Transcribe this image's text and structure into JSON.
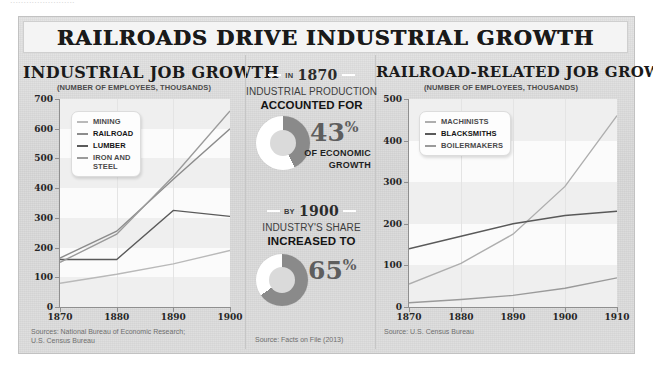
{
  "ghost_text": "........................",
  "banner": {
    "title": "RAILROADS DRIVE INDUSTRIAL GROWTH"
  },
  "colors": {
    "mining": "#b9b9b9",
    "railroad": "#8c8c8c",
    "lumber": "#5a5a5a",
    "iron_steel": "#9b9b9b",
    "machinists": "#aeaeae",
    "blacksmiths": "#595959",
    "boilermakers": "#9a9a9a",
    "donut_filled": "#ffffff",
    "donut_remainder": "#8a8a8a",
    "poster_bg": "#d9d9d9",
    "plot_bg": "#fbfbfb",
    "band": "#efefef",
    "text": "#1a1a1a"
  },
  "left_panel": {
    "title": "INDUSTRIAL JOB GROWTH",
    "subtitle": "(NUMBER OF EMPLOYEES, THOUSANDS)",
    "source": "Sources: National Bureau of Economic Research;\nU.S. Census Bureau",
    "legend": [
      {
        "label": "MINING",
        "color": "#b9b9b9",
        "bold": false
      },
      {
        "label": "RAILROAD",
        "color": "#8c8c8c",
        "bold": true
      },
      {
        "label": "LUMBER",
        "color": "#5a5a5a",
        "bold": true
      },
      {
        "label": "IRON AND\nSTEEL",
        "color": "#9b9b9b",
        "bold": false
      }
    ]
  },
  "mid_panel": {
    "source": "Source: Facts on File (2013)",
    "stats": [
      {
        "year_pre": "IN",
        "year": "1870",
        "line1": "INDUSTRIAL PRODUCTION",
        "line2": "ACCOUNTED FOR",
        "percent": "43",
        "percent_symbol": "%",
        "tail": "OF ECONOMIC\nGROWTH"
      },
      {
        "year_pre": "BY",
        "year": "1900",
        "line1": "INDUSTRY'S SHARE",
        "line2": "INCREASED TO",
        "percent": "65",
        "percent_symbol": "%",
        "tail": ""
      }
    ]
  },
  "right_panel": {
    "title": "RAILROAD-RELATED JOB GROWTH",
    "subtitle": "(NUMBER OF EMPLOYEES, THOUSANDS)",
    "source": "Source: U.S. Census Bureau",
    "legend": [
      {
        "label": "MACHINISTS",
        "color": "#aeaeae",
        "bold": false
      },
      {
        "label": "BLACKSMITHS",
        "color": "#595959",
        "bold": true
      },
      {
        "label": "BOILERMAKERS",
        "color": "#9a9a9a",
        "bold": false
      }
    ]
  },
  "chart_data": [
    {
      "id": "industrial-job-growth",
      "type": "line",
      "title": "INDUSTRIAL JOB GROWTH",
      "subtitle": "(NUMBER OF EMPLOYEES, THOUSANDS)",
      "xlabel": "",
      "ylabel": "NUMBER OF EMPLOYEES, THOUSANDS",
      "x": [
        1870,
        1880,
        1890,
        1900
      ],
      "xticks": [
        "1870",
        "1880",
        "1890",
        "1900"
      ],
      "yticks": [
        0,
        100,
        200,
        300,
        400,
        500,
        600,
        700
      ],
      "xlim": [
        1870,
        1900
      ],
      "ylim": [
        0,
        700
      ],
      "grid": true,
      "legend_position": "top-left",
      "series": [
        {
          "name": "MINING",
          "color": "#b9b9b9",
          "values": [
            80,
            110,
            145,
            190
          ]
        },
        {
          "name": "RAILROAD",
          "color": "#8c8c8c",
          "values": [
            165,
            255,
            430,
            600
          ]
        },
        {
          "name": "LUMBER",
          "color": "#5a5a5a",
          "values": [
            160,
            160,
            325,
            305
          ]
        },
        {
          "name": "IRON AND STEEL",
          "color": "#9b9b9b",
          "values": [
            150,
            245,
            440,
            660
          ]
        }
      ],
      "source": "Sources: National Bureau of Economic Research; U.S. Census Bureau"
    },
    {
      "id": "railroad-related-job-growth",
      "type": "line",
      "title": "RAILROAD-RELATED JOB GROWTH",
      "subtitle": "(NUMBER OF EMPLOYEES, THOUSANDS)",
      "xlabel": "",
      "ylabel": "NUMBER OF EMPLOYEES, THOUSANDS",
      "x": [
        1870,
        1880,
        1890,
        1900,
        1910
      ],
      "xticks": [
        "1870",
        "1880",
        "1890",
        "1900",
        "1910"
      ],
      "yticks": [
        0,
        100,
        200,
        300,
        400,
        500
      ],
      "xlim": [
        1870,
        1910
      ],
      "ylim": [
        0,
        500
      ],
      "grid": true,
      "legend_position": "top-left",
      "series": [
        {
          "name": "MACHINISTS",
          "color": "#aeaeae",
          "values": [
            55,
            105,
            175,
            290,
            460
          ]
        },
        {
          "name": "BLACKSMITHS",
          "color": "#595959",
          "values": [
            140,
            170,
            200,
            220,
            230
          ]
        },
        {
          "name": "BOILERMAKERS",
          "color": "#9a9a9a",
          "values": [
            10,
            18,
            28,
            45,
            70
          ]
        }
      ],
      "source": "Source: U.S. Census Bureau"
    },
    {
      "id": "industrial-share-1870",
      "type": "pie",
      "title": "IN 1870 INDUSTRIAL PRODUCTION ACCOUNTED FOR 43% OF ECONOMIC GROWTH",
      "labels": [
        "Industrial production share",
        "Remainder"
      ],
      "values": [
        43,
        57
      ],
      "colors": [
        "#ffffff",
        "#8a8a8a"
      ],
      "source": "Source: Facts on File (2013)"
    },
    {
      "id": "industrial-share-1900",
      "type": "pie",
      "title": "BY 1900 INDUSTRY'S SHARE INCREASED TO 65%",
      "labels": [
        "Industry share",
        "Remainder"
      ],
      "values": [
        65,
        35
      ],
      "colors": [
        "#ffffff",
        "#8a8a8a"
      ],
      "source": "Source: Facts on File (2013)"
    }
  ]
}
